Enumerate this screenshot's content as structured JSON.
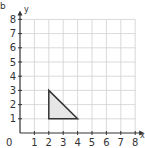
{
  "chart_data": {
    "type": "diagram",
    "title": "",
    "xlabel": "x",
    "ylabel": "y",
    "xlim": [
      0,
      8
    ],
    "ylim": [
      0,
      8
    ],
    "x_ticks": [
      "1",
      "2",
      "3",
      "4",
      "5",
      "6",
      "7",
      "8"
    ],
    "y_ticks": [
      "1",
      "2",
      "3",
      "4",
      "5",
      "6",
      "7",
      "8"
    ],
    "origin_label": "0",
    "grid": true,
    "shapes": [
      {
        "type": "triangle",
        "vertices": [
          [
            2,
            1
          ],
          [
            2,
            3
          ],
          [
            4,
            1
          ]
        ],
        "fill": "#e6e6e6",
        "stroke": "#333333"
      }
    ]
  },
  "labels": {
    "x_axis": "x",
    "y_axis": "y",
    "origin": "0",
    "corner_mark": "b"
  },
  "colors": {
    "grid": "#d0d0d0",
    "axis": "#333333",
    "shape_fill": "#e6e6e6",
    "shape_stroke": "#333333"
  }
}
